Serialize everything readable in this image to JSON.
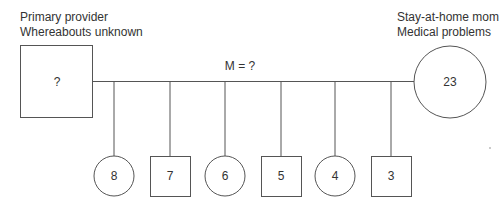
{
  "diagram": {
    "type": "genogram",
    "father": {
      "shape": "square",
      "symbol_text": "?",
      "notes": [
        "Primary provider",
        "Whereabouts unknown"
      ]
    },
    "mother": {
      "shape": "circle",
      "symbol_text": "23",
      "notes": [
        "Stay-at-home mom",
        "Medical problems"
      ]
    },
    "marriage_label": "M = ?",
    "children": [
      {
        "shape": "circle",
        "age": "8"
      },
      {
        "shape": "square",
        "age": "7"
      },
      {
        "shape": "circle",
        "age": "6"
      },
      {
        "shape": "square",
        "age": "5"
      },
      {
        "shape": "circle",
        "age": "4"
      },
      {
        "shape": "square",
        "age": "3"
      }
    ],
    "line_color": "#555555"
  }
}
